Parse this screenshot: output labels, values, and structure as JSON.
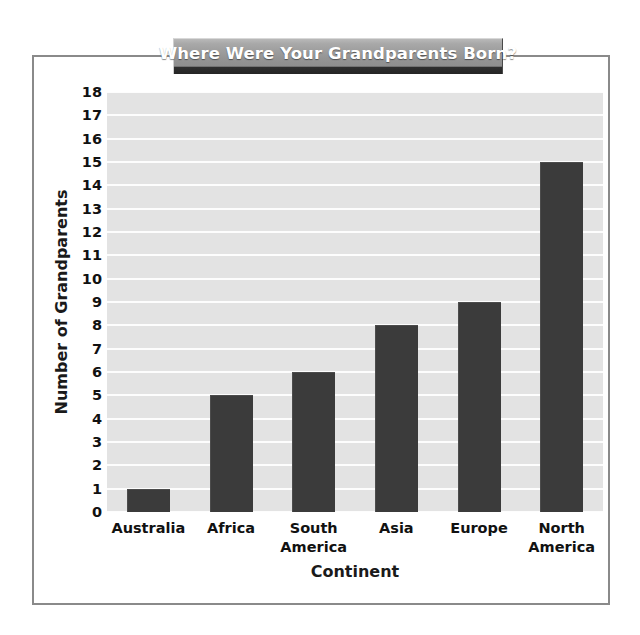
{
  "chart_data": {
    "type": "bar",
    "title": "Where Were Your Grandparents Born?",
    "xlabel": "Continent",
    "ylabel": "Number of Grandparents",
    "categories": [
      "Australia",
      "Africa",
      "South America",
      "Asia",
      "Europe",
      "North America"
    ],
    "values": [
      1,
      5,
      6,
      8,
      9,
      15
    ],
    "ylim": [
      0,
      18
    ],
    "ytick_labels": [
      "0",
      "1",
      "2",
      "3",
      "4",
      "5",
      "6",
      "7",
      "8",
      "9",
      "10",
      "11",
      "12",
      "13",
      "14",
      "15",
      "16",
      "17",
      "18"
    ],
    "ytick_step": 1,
    "grid": true,
    "legend": "none",
    "colors": {
      "bar": "#3b3b3b",
      "plot_background": "#e3e3e3",
      "gridline": "#fdfdfd",
      "frame_border": "#8a8a8a",
      "banner": "#949494",
      "banner_text": "#ffffff",
      "text": "#111111",
      "page_background": "#ffffff"
    }
  }
}
